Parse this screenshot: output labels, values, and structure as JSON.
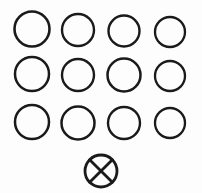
{
  "figure": {
    "background_color": "#fdfdfd",
    "stroke_color": "#1a1a1a",
    "width": 202,
    "height": 193
  },
  "chart_data": {
    "type": "scatter",
    "xlabel": "",
    "ylabel": "",
    "grid": false,
    "legend": null,
    "xlim": [
      0,
      202
    ],
    "ylim": [
      0,
      193
    ],
    "rows": 3,
    "columns": 4,
    "total_plain_circles": 12,
    "total_marked_circles": 1,
    "marks": [
      "open-circle",
      "crossed-circle"
    ],
    "series": [
      {
        "name": "open-circles",
        "marker": "open-circle",
        "filled": false,
        "count": 12,
        "points": [
          {
            "label": "r1c1",
            "x": 32,
            "y": 29,
            "r": 17.5,
            "stroke_width": 2.6
          },
          {
            "label": "r1c2",
            "x": 78,
            "y": 30,
            "r": 16.0,
            "stroke_width": 2.4
          },
          {
            "label": "r1c3",
            "x": 124,
            "y": 31,
            "r": 15.5,
            "stroke_width": 2.4
          },
          {
            "label": "r1c4",
            "x": 170,
            "y": 32,
            "r": 15.0,
            "stroke_width": 2.3
          },
          {
            "label": "r2c1",
            "x": 32,
            "y": 74,
            "r": 17.0,
            "stroke_width": 2.5
          },
          {
            "label": "r2c2",
            "x": 78,
            "y": 75,
            "r": 16.0,
            "stroke_width": 2.4
          },
          {
            "label": "r2c3",
            "x": 124,
            "y": 75,
            "r": 16.5,
            "stroke_width": 2.5
          },
          {
            "label": "r2c4",
            "x": 170,
            "y": 76,
            "r": 15.0,
            "stroke_width": 2.3
          },
          {
            "label": "r3c1",
            "x": 32,
            "y": 122,
            "r": 17.0,
            "stroke_width": 2.5
          },
          {
            "label": "r3c2",
            "x": 78,
            "y": 123,
            "r": 16.5,
            "stroke_width": 2.5
          },
          {
            "label": "r3c3",
            "x": 124,
            "y": 123,
            "r": 16.0,
            "stroke_width": 2.4
          },
          {
            "label": "r3c4",
            "x": 170,
            "y": 123,
            "r": 15.0,
            "stroke_width": 2.3
          }
        ]
      },
      {
        "name": "crossed-circle",
        "marker": "crossed-circle",
        "filled": false,
        "count": 1,
        "points": [
          {
            "label": "crossed",
            "x": 101,
            "y": 171,
            "r": 16.0,
            "stroke_width": 2.8
          }
        ]
      }
    ]
  }
}
